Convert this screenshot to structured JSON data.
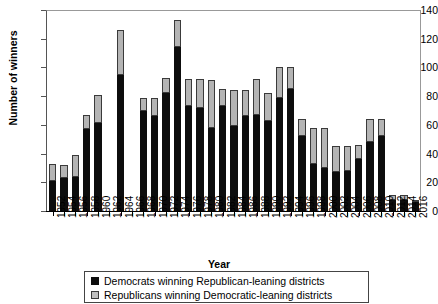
{
  "chart_data": {
    "type": "bar",
    "subtype": "stacked-vertical",
    "title": "",
    "xlabel": "Year",
    "ylabel": "Number of winners",
    "ylim": [
      0,
      140
    ],
    "yticks": [
      0,
      20,
      40,
      60,
      80,
      100,
      120,
      140
    ],
    "grid": false,
    "legend_position": "bottom",
    "categories": [
      "1952",
      "1954",
      "1956",
      "1958",
      "1960",
      "1962",
      "1964",
      "1966",
      "1968",
      "1970",
      "1972",
      "1974",
      "1976",
      "1978",
      "1980",
      "1982",
      "1984",
      "1986",
      "1988",
      "1990",
      "1992",
      "1994",
      "1996",
      "1998",
      "2000",
      "2002",
      "2004",
      "2006",
      "2008",
      "2010",
      "2012",
      "2014",
      "2016"
    ],
    "series": [
      {
        "name": "Democrats winning Republican-leaning districts",
        "color": "#0d0d0d",
        "values": [
          21,
          23,
          24,
          57,
          61,
          0,
          95,
          0,
          70,
          66,
          82,
          114,
          73,
          72,
          58,
          73,
          59,
          66,
          67,
          63,
          79,
          85,
          52,
          33,
          30,
          27,
          28,
          36,
          48,
          52,
          8,
          8,
          6
        ]
      },
      {
        "name": "Republicans winning Democratic-leaning districts",
        "color": "#b4b4b4",
        "values": [
          12,
          9,
          15,
          10,
          20,
          0,
          31,
          0,
          9,
          13,
          11,
          19,
          19,
          20,
          33,
          12,
          25,
          18,
          25,
          19,
          21,
          15,
          12,
          25,
          28,
          18,
          17,
          10,
          16,
          12,
          3,
          3,
          2
        ]
      }
    ],
    "totals": [
      33,
      32,
      39,
      67,
      81,
      0,
      126,
      0,
      79,
      79,
      93,
      133,
      92,
      92,
      91,
      85,
      84,
      84,
      92,
      82,
      100,
      100,
      64,
      58,
      58,
      45,
      45,
      46,
      64,
      64,
      11,
      11,
      8
    ]
  },
  "axis": {
    "y_title": "Number of winners",
    "x_title": "Year"
  },
  "legend": {
    "entries": [
      {
        "swatch": "black-square",
        "label": "Democrats winning Republican-leaning districts"
      },
      {
        "swatch": "gray-square",
        "label": "Republicans winning Democratic-leaning districts"
      }
    ]
  }
}
